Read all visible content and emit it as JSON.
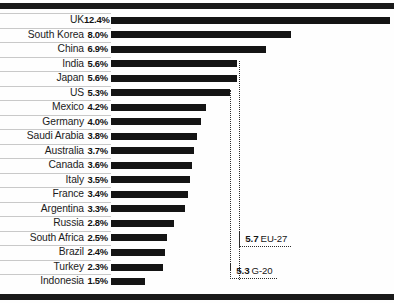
{
  "chart_data": {
    "type": "bar",
    "orientation": "horizontal",
    "title": "",
    "subtitle": "",
    "xlabel": "",
    "ylabel": "",
    "grid": false,
    "legend": "none",
    "xlim": [
      0,
      12.4
    ],
    "value_suffix": "%",
    "categories": [
      "UK",
      "South Korea",
      "China",
      "India",
      "Japan",
      "US",
      "Mexico",
      "Germany",
      "Saudi Arabia",
      "Australia",
      "Canada",
      "Italy",
      "France",
      "Argentina",
      "Russia",
      "South Africa",
      "Brazil",
      "Turkey",
      "Indonesia"
    ],
    "values": [
      12.4,
      8.0,
      6.9,
      5.6,
      5.6,
      5.3,
      4.2,
      4.0,
      3.8,
      3.7,
      3.6,
      3.5,
      3.4,
      3.3,
      2.8,
      2.5,
      2.4,
      2.3,
      1.5
    ],
    "value_labels": [
      "12.4%",
      "8.0%",
      "6.9%",
      "5.6%",
      "5.6%",
      "5.3%",
      "4.2%",
      "4.0%",
      "3.8%",
      "3.7%",
      "3.6%",
      "3.5%",
      "3.4%",
      "3.3%",
      "2.8%",
      "2.5%",
      "2.4%",
      "2.3%",
      "1.5%"
    ],
    "bar_color": "#141414",
    "annotations": [
      {
        "value": 5.7,
        "number": "5.7",
        "name": "EU-27"
      },
      {
        "value": 5.3,
        "number": "5.3",
        "name": "G-20"
      }
    ]
  },
  "rows": [
    {
      "label": "UK",
      "value_label": "12.4%",
      "value": 12.4
    },
    {
      "label": "South Korea",
      "value_label": "8.0%",
      "value": 8.0
    },
    {
      "label": "China",
      "value_label": "6.9%",
      "value": 6.9
    },
    {
      "label": "India",
      "value_label": "5.6%",
      "value": 5.6
    },
    {
      "label": "Japan",
      "value_label": "5.6%",
      "value": 5.6
    },
    {
      "label": "US",
      "value_label": "5.3%",
      "value": 5.3
    },
    {
      "label": "Mexico",
      "value_label": "4.2%",
      "value": 4.2
    },
    {
      "label": "Germany",
      "value_label": "4.0%",
      "value": 4.0
    },
    {
      "label": "Saudi Arabia",
      "value_label": "3.8%",
      "value": 3.8
    },
    {
      "label": "Australia",
      "value_label": "3.7%",
      "value": 3.7
    },
    {
      "label": "Canada",
      "value_label": "3.6%",
      "value": 3.6
    },
    {
      "label": "Italy",
      "value_label": "3.5%",
      "value": 3.5
    },
    {
      "label": "France",
      "value_label": "3.4%",
      "value": 3.4
    },
    {
      "label": "Argentina",
      "value_label": "3.3%",
      "value": 3.3
    },
    {
      "label": "Russia",
      "value_label": "2.8%",
      "value": 2.8
    },
    {
      "label": "South Africa",
      "value_label": "2.5%",
      "value": 2.5
    },
    {
      "label": "Brazil",
      "value_label": "2.4%",
      "value": 2.4
    },
    {
      "label": "Turkey",
      "value_label": "2.3%",
      "value": 2.3
    },
    {
      "label": "Indonesia",
      "value_label": "1.5%",
      "value": 1.5
    }
  ],
  "annotations": [
    {
      "number": "5.7",
      "name": "EU-27",
      "value": 5.7
    },
    {
      "number": "5.3",
      "name": "G-20",
      "value": 5.3
    }
  ]
}
